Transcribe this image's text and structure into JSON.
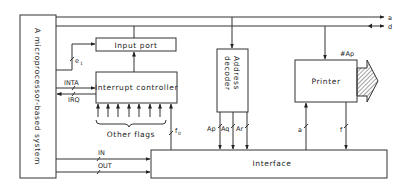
{
  "diagram": {
    "system_box": {
      "label": "A microprocessor-based system"
    },
    "buses": [
      {
        "id": "a",
        "label": "a",
        "direction": "out"
      },
      {
        "id": "d",
        "label": "d",
        "direction": "bidirectional"
      }
    ],
    "blocks": {
      "input_port": {
        "label": "Input port"
      },
      "interrupt_controller": {
        "label": "Interrupt controller"
      },
      "address_decoder": {
        "label": "Address decoder",
        "line1": "Address",
        "line2": "decoder"
      },
      "printer": {
        "label": "Printer",
        "tag": "#Ap"
      },
      "interface": {
        "label": "Interface"
      }
    },
    "signals": {
      "e1": "e",
      "e1_sub": "1",
      "inta": "INTA",
      "irq": "IRQ",
      "other_flags": "Other flags",
      "f0": "f",
      "f0_sub": "0",
      "in": "IN",
      "out": "OUT",
      "ap": "Ap",
      "aq": "Aq",
      "ar": "Ar",
      "a_sig": "a",
      "f_sig": "f"
    },
    "other_flags_count": 7
  }
}
